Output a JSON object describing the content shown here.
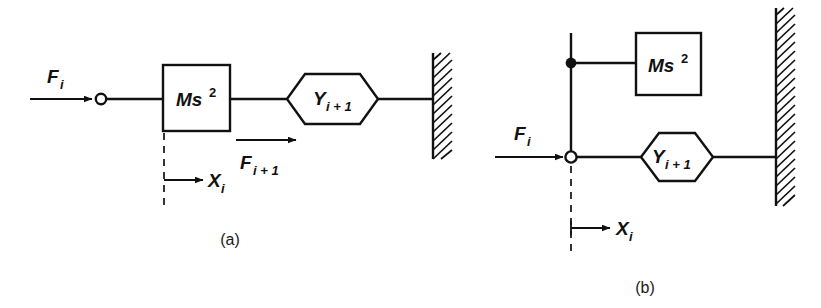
{
  "figure": {
    "background_color": "#ffffff",
    "line_color": "#111111"
  },
  "panels": [
    {
      "id": "a",
      "caption": "(a)",
      "input_force_label": {
        "base": "F",
        "sub": "i"
      },
      "block_label": {
        "base": "Ms",
        "sup": "2"
      },
      "hex_label": {
        "base": "Y",
        "sub": "i + 1"
      },
      "output_force_label": {
        "base": "F",
        "sub": "i + 1"
      },
      "displacement_label": {
        "base": "X",
        "sub": "i"
      },
      "junction_type": "open-circle",
      "wall": "hatched-right"
    },
    {
      "id": "b",
      "caption": "(b)",
      "input_force_label": {
        "base": "F",
        "sub": "i"
      },
      "block_label": {
        "base": "Ms",
        "sup": "2"
      },
      "hex_label": {
        "base": "Y",
        "sub": "i + 1"
      },
      "displacement_label": {
        "base": "X",
        "sub": "i"
      },
      "junction_type": "open-circle",
      "node_type": "filled-dot",
      "wall": "hatched-right"
    }
  ],
  "text": {
    "panel_a_caption": "(a)",
    "panel_b_caption": "(b)",
    "F": "F",
    "i": "i",
    "i_plus_1": "i + 1",
    "Ms": "Ms",
    "two": "2",
    "Y": "Y",
    "X": "X"
  }
}
